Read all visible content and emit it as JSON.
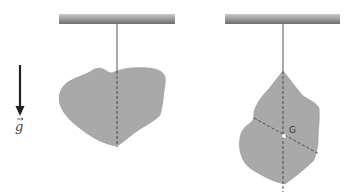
{
  "diagram": {
    "gravity_vector": {
      "label": "g",
      "icon": "down-arrow-icon",
      "has_vector_arrow": true
    },
    "left_figure": {
      "support": "horizontal-bar",
      "suspension": "string",
      "body": "irregular-gray-lamina",
      "construction_line": "vertical-dashed"
    },
    "right_figure": {
      "support": "horizontal-bar",
      "suspension": "string",
      "body": "irregular-gray-lamina",
      "construction_lines": [
        "vertical-dashed",
        "diagonal-dashed"
      ],
      "point_label": "G"
    },
    "colors": {
      "body_fill": "#a9a9a9",
      "body_stroke": "#8a8a8a",
      "bar_fill": "#9a9a9a",
      "line": "#555555",
      "dashed": "#4a4a4a"
    }
  }
}
